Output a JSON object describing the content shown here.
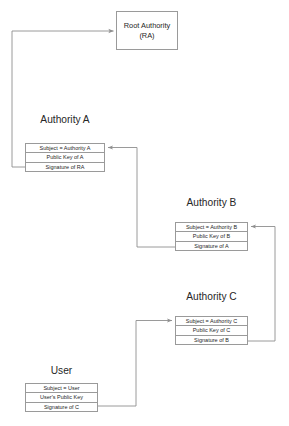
{
  "diagram": {
    "colors": {
      "stroke": "#9a9a9a",
      "text": "#262626",
      "background": "#ffffff"
    },
    "root": {
      "line1": "Root Authority",
      "line2": "(RA)"
    },
    "sections": [
      {
        "id": "authority-a",
        "heading": "Authority A",
        "rows": [
          "Subject = Authority A",
          "Public Key of A",
          "Signature of RA"
        ]
      },
      {
        "id": "authority-b",
        "heading": "Authority B",
        "rows": [
          "Subject = Authority B",
          "Public Key of B",
          "Signature of A"
        ]
      },
      {
        "id": "authority-c",
        "heading": "Authority C",
        "rows": [
          "Subject = Authority C",
          "Public Key of C",
          "Signature of B"
        ]
      },
      {
        "id": "user",
        "heading": "User",
        "rows": [
          "Subject = User",
          "User's Public Key",
          "Signature of C"
        ]
      }
    ],
    "connectors": [
      {
        "id": "a-signature-to-root",
        "from": "authority-a.signature-of-ra",
        "to": "root-authority"
      },
      {
        "id": "b-signature-to-a",
        "from": "authority-b.signature-of-a",
        "to": "authority-a.subject"
      },
      {
        "id": "c-signature-to-b",
        "from": "authority-c.signature-of-b",
        "to": "authority-b.subject"
      },
      {
        "id": "user-signature-to-c",
        "from": "user.signature-of-c",
        "to": "authority-c.subject"
      }
    ]
  }
}
